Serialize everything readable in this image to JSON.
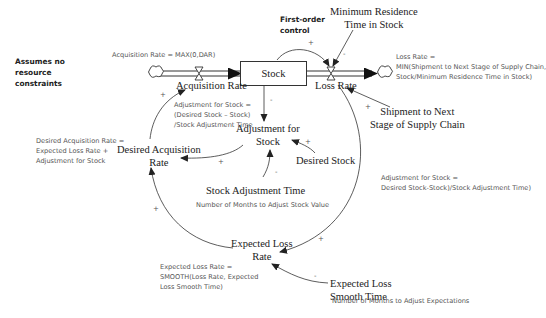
{
  "title_notes": {
    "assumption": [
      "Assumes no",
      "resource",
      "constraints"
    ],
    "control": [
      "First-order",
      "control"
    ]
  },
  "stocks": {
    "stock": "Stock"
  },
  "flows": {
    "acquisition_rate": "Acquisition Rate",
    "loss_rate": "Loss Rate"
  },
  "variables": {
    "min_residence": [
      "Minimum Residence",
      "Time in Stock"
    ],
    "shipment": [
      "Shipment to Next",
      "Stage of Supply Chain"
    ],
    "adjustment_for_stock": [
      "Adjustment for",
      "Stock"
    ],
    "desired_stock": "Desired Stock",
    "desired_acquisition_rate": [
      "Desired Acquisition",
      "Rate"
    ],
    "stock_adjustment_time": "Stock Adjustment Time",
    "expected_loss_rate": [
      "Expected Loss",
      "Rate"
    ],
    "expected_loss_smooth_time": [
      "Expected Loss",
      "Smooth Time"
    ]
  },
  "equations": {
    "acquisition_rate": "Acquisition Rate = MAX(0,DAR)",
    "loss_rate": [
      "Loss Rate =",
      "MIN(Shipment to Next Stage of Supply Chain,",
      "Stock/Minimum Residence Time in Stock)"
    ],
    "adjustment_inner": [
      "Adjustment for Stock =",
      "(Desired Stock – Stock)",
      "/Stock Adjustment Time"
    ],
    "desired_acquisition_rate": [
      "Desired Acquisition Rate =",
      "Expected Loss Rate +",
      "Adjustment for Stock"
    ],
    "adjustment_right": [
      "Adjustment for Stock =",
      "Desired Stock-Stock)/Stock Adjustment Time)"
    ],
    "stock_adjustment_time_note": "Number of Months to Adjust Stock Value",
    "expected_loss_rate": [
      "Expected Loss Rate =",
      "SMOOTH(Loss Rate, Expected",
      "Loss Smooth Time)"
    ],
    "expected_loss_smooth_time_note": "Number of Months to Adjust Expectations"
  },
  "polarities": {
    "stock_to_loss": "+",
    "min_res_to_loss": "-",
    "shipment_to_loss": "+",
    "stock_to_adj": "-",
    "desired_stock_to_adj": "+",
    "sat_to_adj": "-",
    "adj_to_dar": "+",
    "dar_to_acq": "+",
    "elr_to_dar": "+",
    "loss_to_elr": "+",
    "elst_to_elr": "-"
  }
}
